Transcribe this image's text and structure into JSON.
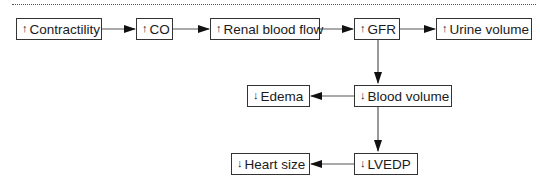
{
  "diagram": {
    "nodes": [
      {
        "id": "contractility",
        "arrow": "↑",
        "label": "Contractility"
      },
      {
        "id": "co",
        "arrow": "↑",
        "label": "CO"
      },
      {
        "id": "renal",
        "arrow": "↑",
        "label": "Renal blood flow"
      },
      {
        "id": "gfr",
        "arrow": "↑",
        "label": "GFR"
      },
      {
        "id": "urine",
        "arrow": "↑",
        "label": "Urine volume"
      },
      {
        "id": "blood",
        "arrow": "↓",
        "label": "Blood volume"
      },
      {
        "id": "edema",
        "arrow": "↓",
        "label": "Edema"
      },
      {
        "id": "lvedp",
        "arrow": "↓",
        "label": "LVEDP"
      },
      {
        "id": "heart",
        "arrow": "↓",
        "label": "Heart size"
      }
    ],
    "edges": [
      {
        "from": "contractility",
        "to": "co"
      },
      {
        "from": "co",
        "to": "renal"
      },
      {
        "from": "renal",
        "to": "gfr"
      },
      {
        "from": "gfr",
        "to": "urine"
      },
      {
        "from": "gfr",
        "to": "blood"
      },
      {
        "from": "blood",
        "to": "edema"
      },
      {
        "from": "blood",
        "to": "lvedp"
      },
      {
        "from": "lvedp",
        "to": "heart"
      }
    ]
  }
}
